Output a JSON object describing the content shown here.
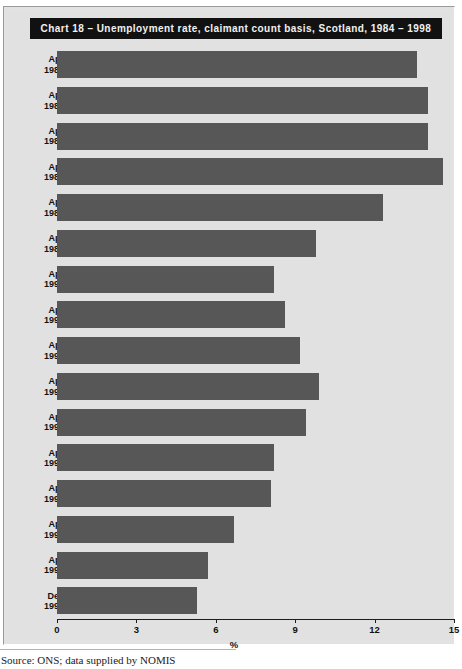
{
  "figure": {
    "title": "Chart 18 – Unemployment rate, claimant count basis, Scotland, 1984 – 1998",
    "source": "Source: ONS; data supplied by NOMIS",
    "bar_color": "#575757",
    "title_bar_color": "#111111",
    "panel_color": "#e1e1e1"
  },
  "chart_data": {
    "type": "bar",
    "orientation": "horizontal",
    "title": "Chart 18 – Unemployment rate, claimant count basis, Scotland, 1984 – 1998",
    "xlabel": "%",
    "ylabel": "",
    "xlim": [
      0,
      15
    ],
    "xticks": [
      0,
      3,
      6,
      9,
      12,
      15
    ],
    "xticklabels": [
      "0",
      "3",
      "6",
      "9",
      "12",
      "15"
    ],
    "grid": false,
    "legend": null,
    "categories": [
      "Apr 1984",
      "Apr 1985",
      "Apr 1986",
      "Apr 1987",
      "Apr 1988",
      "Apr 1989",
      "Apr 1990",
      "Apr 1991",
      "Apr 1992",
      "Apr 1993",
      "Apr 1994",
      "Apr 1995",
      "Apr 1996",
      "Apr 1997",
      "Apr 1998",
      "Dec 1998"
    ],
    "category_lines": [
      [
        "Apr",
        "1984"
      ],
      [
        "Apr",
        "1985"
      ],
      [
        "Apr",
        "1986"
      ],
      [
        "Apr",
        "1987"
      ],
      [
        "Apr",
        "1988"
      ],
      [
        "Apr",
        "1989"
      ],
      [
        "Apr",
        "1990"
      ],
      [
        "Apr",
        "1991"
      ],
      [
        "Apr",
        "1992"
      ],
      [
        "Apr",
        "1993"
      ],
      [
        "Apr",
        "1994"
      ],
      [
        "Apr",
        "1995"
      ],
      [
        "Apr",
        "1996"
      ],
      [
        "Apr",
        "1997"
      ],
      [
        "Apr",
        "1998"
      ],
      [
        "Dec",
        "1998"
      ]
    ],
    "values": [
      13.6,
      14.0,
      14.0,
      14.6,
      12.3,
      9.8,
      8.2,
      8.6,
      9.2,
      9.9,
      9.4,
      8.2,
      8.1,
      6.7,
      5.7,
      5.3
    ]
  }
}
